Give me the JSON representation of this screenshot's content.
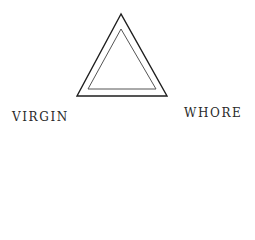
{
  "labels": {
    "left": "VIRGIN",
    "right": "WHORE"
  },
  "shapes": {
    "outer_triangle": {
      "points": "121,14 77,96 167,96",
      "stroke": "#1e1e1e",
      "stroke_width": 1.4
    },
    "inner_triangle": {
      "points": "121,29 88,89 156,89",
      "stroke": "#555555",
      "stroke_width": 1.0
    }
  }
}
